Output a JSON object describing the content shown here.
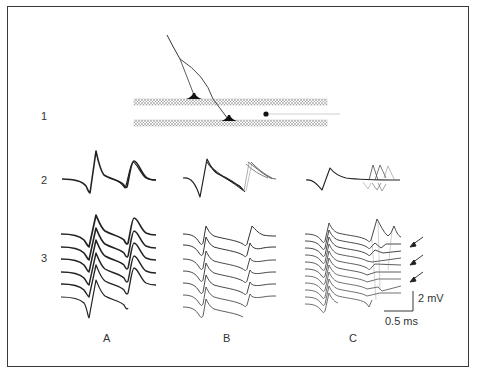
{
  "figure": {
    "row_labels": [
      "1",
      "2",
      "3"
    ],
    "column_labels": [
      "A",
      "B",
      "C"
    ],
    "scale_bar": {
      "voltage": "2 mV",
      "time": "0.5 ms"
    },
    "diagram": {
      "description": "Presynaptic fiber branching to two synaptic terminals on parallel axon bands; recording electrode dot on right",
      "bands": 2,
      "terminals": 2,
      "electrode": "dot"
    },
    "panels": {
      "A": {
        "row3_trace_count": 6
      },
      "B": {
        "row3_trace_count": 7
      },
      "C": {
        "row3_trace_count": 11,
        "arrows": 3
      }
    },
    "colors": {
      "border": "#3a3a3a",
      "trace": "#222222",
      "band": "#888888"
    }
  }
}
